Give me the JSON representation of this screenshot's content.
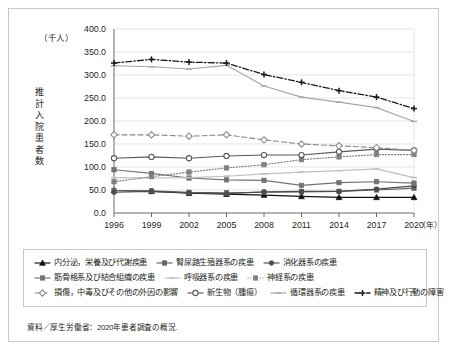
{
  "figure": {
    "unit_label": "（千人）",
    "y_axis_title": "推計入院患者数",
    "x_axis_unit": "（年）",
    "source_note": "資料／厚生労働省：2020年患者調査の概況."
  },
  "chart_data": {
    "type": "line",
    "title": "",
    "xlabel": "（年）",
    "ylabel": "推計入院患者数",
    "unit": "千人",
    "grid": true,
    "legend_position": "bottom",
    "ylim": [
      0,
      400
    ],
    "yticks": [
      "0.0",
      "50.0",
      "100.0",
      "150.0",
      "200.0",
      "250.0",
      "300.0",
      "350.0",
      "400.0"
    ],
    "categories": [
      "1996",
      "1999",
      "2002",
      "2005",
      "2008",
      "2011",
      "2014",
      "2017",
      "2020"
    ],
    "series": [
      {
        "name": "精神及び行動の障害",
        "color": "#1a1a1a",
        "dash": "dashdot",
        "marker": "cross",
        "values": [
          326.0,
          334.0,
          328.0,
          326.0,
          301.0,
          284.0,
          266.0,
          252.0,
          227.0
        ]
      },
      {
        "name": "循環器系の疾患",
        "color": "#a6a6a6",
        "dash": "solid",
        "marker": "dash",
        "values": [
          320.0,
          318.0,
          313.0,
          321.0,
          276.0,
          252.0,
          241.0,
          229.0,
          199.0
        ]
      },
      {
        "name": "損傷，中毒及びその他の外因の影響",
        "color": "#8c8c8c",
        "dash": "dashed",
        "marker": "diamond-open",
        "values": [
          170.0,
          170.0,
          167.0,
          170.0,
          159.0,
          150.0,
          146.0,
          142.0,
          136.0
        ]
      },
      {
        "name": "新生物（腫瘍）",
        "color": "#595959",
        "dash": "solid",
        "marker": "circle-open",
        "values": [
          119.0,
          122.0,
          119.0,
          124.0,
          126.0,
          126.0,
          133.0,
          139.0,
          136.0
        ]
      },
      {
        "name": "神経系の疾患",
        "color": "#808080",
        "dash": "dotted",
        "marker": "square",
        "values": [
          68.0,
          79.0,
          89.0,
          98.0,
          105.0,
          116.0,
          122.0,
          127.0,
          127.0
        ]
      },
      {
        "name": "呼吸器系の疾患",
        "color": "#bfbfbf",
        "dash": "solid",
        "marker": "dash",
        "values": [
          77.0,
          76.0,
          77.0,
          80.0,
          85.0,
          89.0,
          92.0,
          96.0,
          77.0
        ]
      },
      {
        "name": "筋骨格系及び結合組織の疾患",
        "color": "#737373",
        "dash": "solid",
        "marker": "square",
        "values": [
          94.0,
          86.0,
          76.0,
          72.0,
          71.0,
          60.0,
          66.0,
          68.0,
          65.0
        ]
      },
      {
        "name": "消化器系の疾患",
        "color": "#4d4d4d",
        "dash": "solid",
        "marker": "circle-filled",
        "values": [
          45.0,
          47.0,
          44.0,
          42.0,
          46.0,
          47.0,
          47.0,
          52.0,
          59.0
        ]
      },
      {
        "name": "腎尿路生殖器系の疾患",
        "color": "#666666",
        "dash": "solid",
        "marker": "square",
        "values": [
          49.0,
          48.0,
          45.0,
          44.0,
          45.0,
          46.0,
          47.0,
          50.0,
          54.0
        ]
      },
      {
        "name": "内分泌，栄養及び代謝疾患",
        "color": "#111111",
        "dash": "solid",
        "marker": "triangle",
        "values": [
          49.0,
          47.0,
          43.0,
          41.0,
          39.0,
          36.0,
          34.0,
          34.0,
          34.0
        ]
      }
    ]
  },
  "legend": {
    "rows": [
      [
        {
          "label": "内分泌，栄養及び代謝疾患",
          "series": 9
        },
        {
          "label": "腎尿路生殖器系の疾患",
          "series": 8
        },
        {
          "label": "消化器系の疾患",
          "series": 7
        }
      ],
      [
        {
          "label": "筋骨格系及び結合組織の疾患",
          "series": 6
        },
        {
          "label": "呼吸器系の疾患",
          "series": 5
        },
        {
          "label": "神経系の疾患",
          "series": 4
        }
      ],
      [
        {
          "label": "損傷，中毒及びその他の外因の影響",
          "series": 2
        },
        {
          "label": "新生物（腫瘍）",
          "series": 3
        },
        {
          "label": "循環器系の疾患",
          "series": 1
        },
        {
          "label": "精神及び行動の障害",
          "series": 0
        }
      ]
    ]
  }
}
